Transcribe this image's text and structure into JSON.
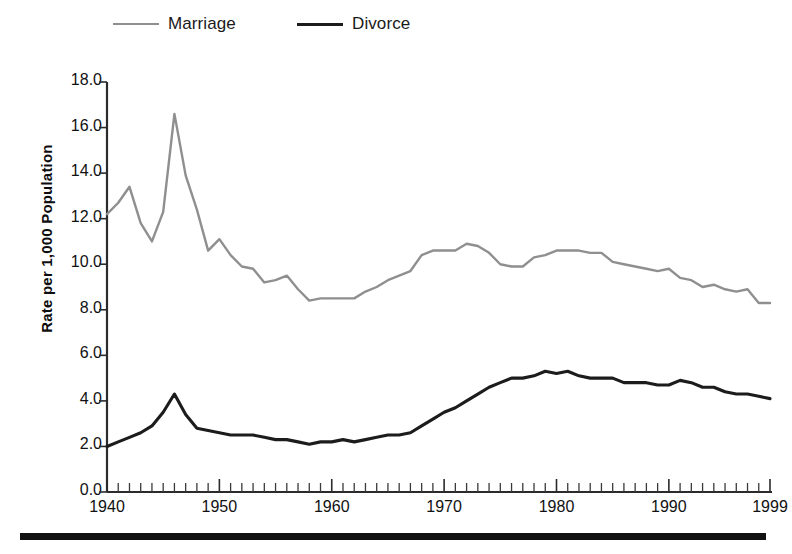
{
  "legend": {
    "position": "top-left",
    "items": [
      {
        "label": "Marriage",
        "color": "#8f8f8f",
        "icon": "line-swatch-icon"
      },
      {
        "label": "Divorce",
        "color": "#1c1c1c",
        "icon": "line-swatch-icon"
      }
    ]
  },
  "axes": {
    "ylabel": "Rate per 1,000 Population",
    "xlabel": "",
    "y_ticks": [
      "0.0",
      "2.0",
      "4.0",
      "6.0",
      "8.0",
      "10.0",
      "12.0",
      "14.0",
      "16.0",
      "18.0"
    ],
    "x_ticks": [
      "1940",
      "1950",
      "1960",
      "1970",
      "1980",
      "1990",
      "1999"
    ]
  },
  "chart_data": {
    "type": "line",
    "title": "",
    "subtitle": "",
    "xlabel": "",
    "ylabel": "Rate per 1,000 Population",
    "xlim": [
      1940,
      1999
    ],
    "ylim": [
      0.0,
      18.0
    ],
    "ytick_step": 2.0,
    "xtick_labeled": [
      1940,
      1950,
      1960,
      1970,
      1980,
      1990,
      1999
    ],
    "xtick_minor_step": 1,
    "grid": false,
    "legend_position": "top-left",
    "x": [
      1940,
      1941,
      1942,
      1943,
      1944,
      1945,
      1946,
      1947,
      1948,
      1949,
      1950,
      1951,
      1952,
      1953,
      1954,
      1955,
      1956,
      1957,
      1958,
      1959,
      1960,
      1961,
      1962,
      1963,
      1964,
      1965,
      1966,
      1967,
      1968,
      1969,
      1970,
      1971,
      1972,
      1973,
      1974,
      1975,
      1976,
      1977,
      1978,
      1979,
      1980,
      1981,
      1982,
      1983,
      1984,
      1985,
      1986,
      1987,
      1988,
      1989,
      1990,
      1991,
      1992,
      1993,
      1994,
      1995,
      1996,
      1997,
      1998,
      1999
    ],
    "series": [
      {
        "name": "Marriage",
        "color": "#8f8f8f",
        "values": [
          12.2,
          12.7,
          13.4,
          11.8,
          11.0,
          12.3,
          16.6,
          13.9,
          12.4,
          10.6,
          11.1,
          10.4,
          9.9,
          9.8,
          9.2,
          9.3,
          9.5,
          8.9,
          8.4,
          8.5,
          8.5,
          8.5,
          8.5,
          8.8,
          9.0,
          9.3,
          9.5,
          9.7,
          10.4,
          10.6,
          10.6,
          10.6,
          10.9,
          10.8,
          10.5,
          10.0,
          9.9,
          9.9,
          10.3,
          10.4,
          10.6,
          10.6,
          10.6,
          10.5,
          10.5,
          10.1,
          10.0,
          9.9,
          9.8,
          9.7,
          9.8,
          9.4,
          9.3,
          9.0,
          9.1,
          8.9,
          8.8,
          8.9,
          8.3,
          8.3
        ]
      },
      {
        "name": "Divorce",
        "color": "#1c1c1c",
        "values": [
          2.0,
          2.2,
          2.4,
          2.6,
          2.9,
          3.5,
          4.3,
          3.4,
          2.8,
          2.7,
          2.6,
          2.5,
          2.5,
          2.5,
          2.4,
          2.3,
          2.3,
          2.2,
          2.1,
          2.2,
          2.2,
          2.3,
          2.2,
          2.3,
          2.4,
          2.5,
          2.5,
          2.6,
          2.9,
          3.2,
          3.5,
          3.7,
          4.0,
          4.3,
          4.6,
          4.8,
          5.0,
          5.0,
          5.1,
          5.3,
          5.2,
          5.3,
          5.1,
          5.0,
          5.0,
          5.0,
          4.8,
          4.8,
          4.8,
          4.7,
          4.7,
          4.9,
          4.8,
          4.6,
          4.6,
          4.4,
          4.3,
          4.3,
          4.2,
          4.1
        ]
      }
    ]
  }
}
